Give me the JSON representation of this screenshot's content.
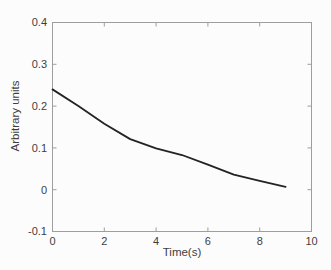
{
  "figure": {
    "background": "#fcfcfc",
    "frame_color": "#9e9e9e",
    "curve_color": "#232323",
    "text_color": "#3e3e3e"
  },
  "chart_data": {
    "type": "line",
    "title": "",
    "xlabel": "Time(s)",
    "ylabel": "Arbitrary units",
    "x": [
      0,
      1,
      2,
      3,
      4,
      5,
      6,
      7,
      8,
      9
    ],
    "series": [
      {
        "name": "decay-curve",
        "values": [
          0.24,
          0.2,
          0.158,
          0.121,
          0.099,
          0.083,
          0.06,
          0.036,
          0.021,
          0.007
        ]
      }
    ],
    "xlim": [
      0,
      10
    ],
    "ylim": [
      -0.1,
      0.4
    ],
    "xticks": [
      0,
      2,
      4,
      6,
      8,
      10
    ],
    "xtick_labels": [
      "0",
      "2",
      "4",
      "6",
      "8",
      "10"
    ],
    "yticks": [
      -0.1,
      0,
      0.1,
      0.2,
      0.3,
      0.4
    ],
    "ytick_labels": [
      "-0.1",
      "0",
      "0.1",
      "0.2",
      "0.3",
      "0.4"
    ],
    "grid": false,
    "legend": "none",
    "line_width_px": 1.8,
    "tick_length_px": 4,
    "tick_style": "inward-mirrored"
  }
}
